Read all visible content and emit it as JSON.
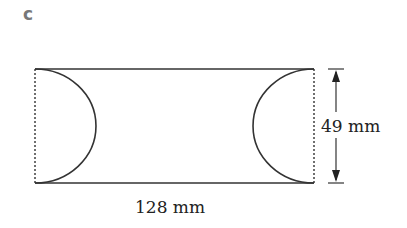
{
  "part_label": "c",
  "figure": {
    "shape": "rectangle with two semicircular cut-outs on the short sides",
    "width_label": "128 mm",
    "height_label": "49 mm",
    "line_color": "#222222"
  }
}
